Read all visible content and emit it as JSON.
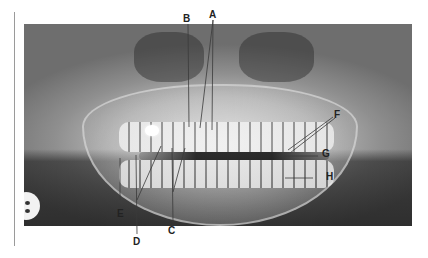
{
  "figure": {
    "type": "panoramic dental radiograph",
    "labels": [
      {
        "id": "A",
        "text": "A"
      },
      {
        "id": "B",
        "text": "B"
      },
      {
        "id": "C",
        "text": "C"
      },
      {
        "id": "D",
        "text": "D"
      },
      {
        "id": "E",
        "text": "E"
      },
      {
        "id": "F",
        "text": "F"
      },
      {
        "id": "G",
        "text": "G"
      },
      {
        "id": "H",
        "text": "H"
      }
    ]
  }
}
